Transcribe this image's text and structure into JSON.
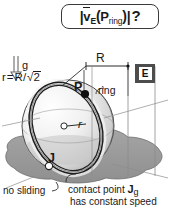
{
  "figure": {
    "kind": "physics-diagram"
  },
  "title_box": {
    "name": "velocity-question",
    "prefix_bar": "|",
    "vector_symbol": "v",
    "vector_subscript": "E",
    "open_paren": "(",
    "point_symbol": "P",
    "point_subscript": "ring",
    "close_paren": ")",
    "suffix_bar": "|",
    "question_mark": "?",
    "plain_text": "|v̄E(Pring)| ?"
  },
  "labels": {
    "gravity": "g",
    "radius_relation_lhs": "r",
    "radius_relation_eq": "=",
    "radius_relation_rhs_num": "R",
    "radius_relation_slash": "/",
    "radius_relation_sqrt": "√",
    "radius_relation_radicand": "2",
    "radius_relation_plain": "r = R/√2",
    "big_R": "R",
    "point_P": "P",
    "ring": "ring",
    "small_r": "r",
    "point_J": "J",
    "center_dot": "o",
    "frame_badge": "E",
    "no_sliding": "no sliding",
    "contact_line_1_prefix": "contact point ",
    "contact_line_1_symbol": "J",
    "contact_line_1_subscript": "g",
    "contact_line_2": "has constant speed",
    "contact_plain": "contact point Jg has constant speed"
  },
  "colors": {
    "ink": "#1a1a1a",
    "ground_fill": "#9a9a9a",
    "ground_stroke": "#6e6e6e",
    "ball_light": "#f2f2f2",
    "ball_shade": "#b9b9b9",
    "ring_stroke": "#1f1f1f",
    "badge_bg": "#4d4d4d",
    "badge_fg": "#111111",
    "leader_line": "#8c8c8c",
    "point_p_fill": "#111111",
    "point_j_fill": "#ffffff"
  },
  "geometry": {
    "ball_center_x": 68,
    "ball_center_y": 126,
    "ball_radius": 46,
    "ring_tilt_deg": 24,
    "point_p": [
      84,
      93
    ],
    "point_j": [
      48,
      165
    ],
    "R_dimension_top_y": 64,
    "R_dimension_left_x": 84,
    "R_dimension_right_x": 128
  }
}
